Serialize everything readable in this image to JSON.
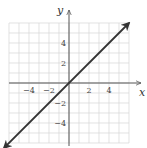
{
  "chart_data": {
    "type": "line",
    "title": "",
    "xlabel": "x",
    "ylabel": "y",
    "xlim": [
      -6,
      6
    ],
    "ylim": [
      -6,
      6
    ],
    "grid": true,
    "grid_step": 1,
    "x_ticks": [
      -4,
      -2,
      2,
      4
    ],
    "y_ticks": [
      4,
      2,
      -2,
      -4
    ],
    "x_tick_labels": [
      "−4",
      "−2",
      "2",
      "4"
    ],
    "y_tick_labels": [
      "4",
      "2",
      "−2",
      "−4"
    ],
    "series": [
      {
        "name": "y = x",
        "x": [
          -6.5,
          6
        ],
        "y": [
          -6.5,
          6
        ],
        "arrows": "both",
        "color": "#333333"
      }
    ]
  },
  "colors": {
    "grid": "#d6d6d6",
    "axis": "#555555",
    "line": "#333333",
    "text": "#444444"
  }
}
